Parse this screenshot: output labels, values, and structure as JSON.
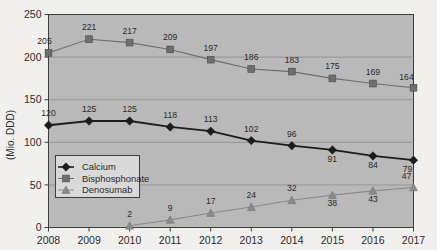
{
  "chart_data": {
    "type": "line",
    "title": "",
    "subtitle": "",
    "xlabel": "",
    "ylabel": "(Mio. DDD)",
    "categories": [
      "2008",
      "2009",
      "2010",
      "2011",
      "2012",
      "2013",
      "2014",
      "2015",
      "2016",
      "2017"
    ],
    "x": [
      2008,
      2009,
      2010,
      2011,
      2012,
      2013,
      2014,
      2015,
      2016,
      2017
    ],
    "ylim": [
      0,
      250
    ],
    "xlim": [
      2008,
      2017
    ],
    "yticks": [
      0,
      50,
      100,
      150,
      200,
      250
    ],
    "ytick_labels": [
      "0",
      "50",
      "100",
      "150",
      "200",
      "250"
    ],
    "grid": true,
    "grid_axis": "y",
    "legend_position": "center-left-inside",
    "plot_background": "#b9b9b9",
    "series": [
      {
        "name": "Calcium",
        "marker": "diamond",
        "color": "#1c1c1c",
        "values": [
          120,
          125,
          125,
          118,
          113,
          102,
          96,
          91,
          84,
          79
        ],
        "labels": [
          "120",
          "125",
          "125",
          "118",
          "113",
          "102",
          "96",
          "91",
          "84",
          "79"
        ]
      },
      {
        "name": "Bisphosphonate",
        "marker": "square",
        "color": "#6e6e6e",
        "values": [
          205,
          221,
          217,
          209,
          197,
          186,
          183,
          175,
          169,
          164
        ],
        "labels": [
          "205",
          "221",
          "217",
          "209",
          "197",
          "186",
          "183",
          "175",
          "169",
          "164"
        ]
      },
      {
        "name": "Denosumab",
        "marker": "triangle",
        "color": "#8a8a8a",
        "values": [
          null,
          null,
          2,
          9,
          17,
          24,
          32,
          38,
          43,
          47
        ],
        "labels": [
          "",
          "",
          "2",
          "9",
          "17",
          "24",
          "32",
          "38",
          "43",
          "47"
        ]
      }
    ]
  },
  "axis": {
    "y_title": "(Mio. DDD)",
    "y_ticks": [
      "250",
      "200",
      "150",
      "100",
      "50",
      "0"
    ],
    "x_ticks": [
      "2008",
      "2009",
      "2010",
      "2011",
      "2012",
      "2013",
      "2014",
      "2015",
      "2016",
      "2017"
    ]
  },
  "legend": {
    "items": [
      {
        "label": "Calcium",
        "marker": "diamond-marker-icon"
      },
      {
        "label": "Bisphosphonate",
        "marker": "square-marker-icon"
      },
      {
        "label": "Denosumab",
        "marker": "triangle-marker-icon"
      }
    ]
  },
  "data_labels": {
    "calcium": [
      "120",
      "125",
      "125",
      "118",
      "113",
      "102",
      "96",
      "91",
      "84",
      "79"
    ],
    "bisphosphonate": [
      "205",
      "221",
      "217",
      "209",
      "197",
      "186",
      "183",
      "175",
      "169",
      "164"
    ],
    "denosumab": [
      "2",
      "9",
      "17",
      "24",
      "32",
      "38",
      "43",
      "47"
    ]
  }
}
